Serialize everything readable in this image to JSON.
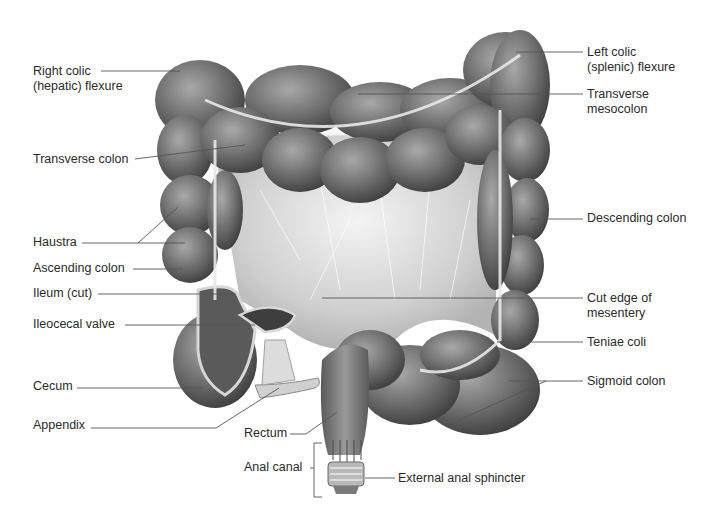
{
  "figure": {
    "colors": {
      "background": "#ffffff",
      "text": "#2a2a2a",
      "leader_line": "#555555",
      "colon_dark": "#4a4a4a",
      "colon_mid": "#7a7a7a",
      "colon_light": "#b8b8b8",
      "mesentery": "#d9d9d9",
      "teniae": "#e6e6e6"
    }
  },
  "labels_left": [
    {
      "id": "right-colic-flexure",
      "lines": [
        "Right colic",
        "(hepatic) flexure"
      ],
      "x": 33,
      "y": 64,
      "line": [
        [
          101,
          71
        ],
        [
          180,
          71
        ]
      ]
    },
    {
      "id": "transverse-colon",
      "lines": [
        "Transverse colon"
      ],
      "x": 33,
      "y": 152,
      "line": [
        [
          135,
          159
        ],
        [
          245,
          145
        ]
      ]
    },
    {
      "id": "haustra",
      "lines": [
        "Haustra"
      ],
      "x": 33,
      "y": 235,
      "line": [
        [
          82,
          243
        ],
        [
          138,
          243
        ],
        [
          178,
          207
        ]
      ],
      "line2": [
        [
          138,
          243
        ],
        [
          185,
          243
        ]
      ]
    },
    {
      "id": "ascending-colon",
      "lines": [
        "Ascending colon"
      ],
      "x": 33,
      "y": 261,
      "line": [
        [
          133,
          269
        ],
        [
          183,
          269
        ]
      ]
    },
    {
      "id": "ileum-cut",
      "lines": [
        "Ileum (cut)"
      ],
      "x": 33,
      "y": 286,
      "line": [
        [
          98,
          294
        ],
        [
          236,
          294
        ]
      ]
    },
    {
      "id": "ileocecal-valve",
      "lines": [
        "Ileocecal valve"
      ],
      "x": 33,
      "y": 317,
      "line": [
        [
          125,
          325
        ],
        [
          255,
          325
        ]
      ]
    },
    {
      "id": "cecum",
      "lines": [
        "Cecum"
      ],
      "x": 33,
      "y": 379,
      "line": [
        [
          77,
          388
        ],
        [
          203,
          388
        ]
      ]
    },
    {
      "id": "appendix",
      "lines": [
        "Appendix"
      ],
      "x": 33,
      "y": 418,
      "line": [
        [
          91,
          428
        ],
        [
          216,
          428
        ],
        [
          279,
          388
        ]
      ]
    }
  ],
  "labels_right": [
    {
      "id": "left-colic-flexure",
      "lines": [
        "Left colic",
        "(splenic) flexure"
      ],
      "x": 587,
      "y": 45,
      "line": [
        [
          516,
          52
        ],
        [
          583,
          52
        ]
      ]
    },
    {
      "id": "transverse-mesocolon",
      "lines": [
        "Transverse",
        "mesocolon"
      ],
      "x": 587,
      "y": 87,
      "line": [
        [
          358,
          94
        ],
        [
          583,
          94
        ]
      ]
    },
    {
      "id": "descending-colon",
      "lines": [
        "Descending colon"
      ],
      "x": 587,
      "y": 211,
      "line": [
        [
          530,
          219
        ],
        [
          583,
          219
        ]
      ]
    },
    {
      "id": "cut-edge-of-mesentery",
      "lines": [
        "Cut edge of",
        "mesentery"
      ],
      "x": 587,
      "y": 291,
      "line": [
        [
          322,
          298
        ],
        [
          583,
          298
        ]
      ]
    },
    {
      "id": "teniae-coli",
      "lines": [
        "Teniae coli"
      ],
      "x": 587,
      "y": 335,
      "line": [
        [
          497,
          342
        ],
        [
          583,
          342
        ]
      ]
    },
    {
      "id": "sigmoid-colon",
      "lines": [
        "Sigmoid colon"
      ],
      "x": 587,
      "y": 374,
      "line": [
        [
          508,
          381
        ],
        [
          583,
          381
        ]
      ],
      "line2": [
        [
          546,
          381
        ],
        [
          459,
          420
        ]
      ]
    }
  ],
  "labels_bottom": [
    {
      "id": "rectum",
      "lines": [
        "Rectum"
      ],
      "x": 244,
      "y": 426,
      "line": [
        [
          290,
          434
        ],
        [
          306,
          434
        ],
        [
          337,
          412
        ]
      ]
    },
    {
      "id": "anal-canal",
      "lines": [
        "Anal canal"
      ],
      "x": 244,
      "y": 460,
      "bracket": [
        [
          322,
          443
        ],
        [
          314,
          443
        ],
        [
          314,
          497
        ],
        [
          322,
          497
        ]
      ],
      "tick": [
        [
          310,
          468
        ],
        [
          314,
          468
        ]
      ]
    },
    {
      "id": "external-anal-sphincter",
      "lines": [
        "External anal sphincter"
      ],
      "x": 398,
      "y": 471,
      "line": [
        [
          365,
          478
        ],
        [
          395,
          478
        ]
      ]
    }
  ]
}
